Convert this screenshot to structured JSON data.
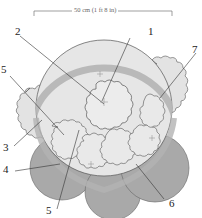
{
  "diagram": {
    "type": "planting-plan",
    "dimension_label": "50 cm (1 ft 8 in)",
    "callouts": [
      {
        "id": "1",
        "label": "1"
      },
      {
        "id": "2",
        "label": "2"
      },
      {
        "id": "3",
        "label": "3"
      },
      {
        "id": "4",
        "label": "4"
      },
      {
        "id": "5a",
        "label": "5"
      },
      {
        "id": "5b",
        "label": "5"
      },
      {
        "id": "6",
        "label": "6"
      },
      {
        "id": "7",
        "label": "7"
      }
    ],
    "colors": {
      "outline": "#555555",
      "large_circle_fill": "#e6e6e6",
      "ring_band": "#b9b9b9",
      "rosette_fill": "#e9e9e9",
      "dark_circle_fill": "#a9a9a9",
      "leader_line": "#333333"
    }
  }
}
